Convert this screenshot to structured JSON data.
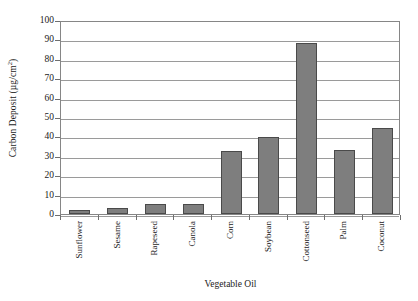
{
  "chart_data": {
    "type": "bar",
    "title": "",
    "subtitle": "",
    "xlabel": "Vegetable Oil",
    "ylabel": "Carbon Deposit (µg/cm²)",
    "ylabel_parts": {
      "text": "Carbon Deposit (µg/cm",
      "sup": "2",
      "tail": ")"
    },
    "categories": [
      "Sunflower",
      "Sesame",
      "Rapeseed",
      "Canola",
      "Corn",
      "Soybean",
      "Cottonseed",
      "Palm",
      "Coconut"
    ],
    "values": [
      2,
      3,
      5,
      5,
      32.5,
      39.5,
      88,
      33,
      44.5
    ],
    "series": [
      {
        "name": "Carbon Deposit",
        "values": [
          2,
          3,
          5,
          5,
          32.5,
          39.5,
          88,
          33,
          44.5
        ]
      }
    ],
    "ylim": [
      0,
      100
    ],
    "xlim": [
      0,
      9
    ],
    "ytick_labels": [
      "0",
      "10",
      "20",
      "30",
      "40",
      "50",
      "60",
      "70",
      "80",
      "90",
      "100"
    ],
    "ytick_values": [
      0,
      10,
      20,
      30,
      40,
      50,
      60,
      70,
      80,
      90,
      100
    ],
    "ytick_step": 10,
    "grid": "horizontal",
    "legend": "none",
    "legend_position": "none",
    "bar_color": "#7e7e7e",
    "bar_edge_color": "#4a4a4a",
    "grid_color": "#9a9a9a",
    "frame_color": "#868686",
    "background_color": "#ffffff",
    "xtick_label_rotation": -90,
    "annotations": []
  }
}
